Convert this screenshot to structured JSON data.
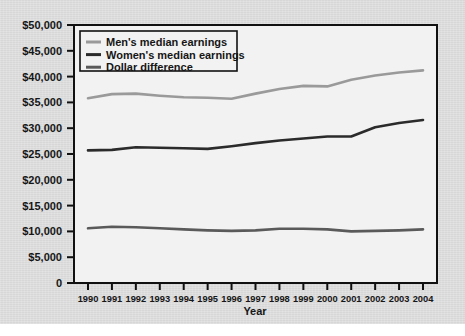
{
  "chart_data": {
    "type": "line",
    "title": "",
    "xlabel": "Year",
    "ylabel": "",
    "x": [
      1990,
      1991,
      1992,
      1993,
      1994,
      1995,
      1996,
      1997,
      1998,
      1999,
      2000,
      2001,
      2002,
      2003,
      2004
    ],
    "xtick_labels": [
      "1990",
      "1991",
      "1992",
      "1993",
      "1994",
      "1995",
      "1996",
      "1997",
      "1998",
      "1999",
      "2000",
      "2001",
      "2002",
      "2003",
      "2004"
    ],
    "ytick_labels": [
      "0",
      "$5,000",
      "$10,000",
      "$15,000",
      "$20,000",
      "$25,000",
      "$30,000",
      "$35,000",
      "$40,000",
      "$45,000",
      "$50,000"
    ],
    "ytick_values": [
      0,
      5000,
      10000,
      15000,
      20000,
      25000,
      30000,
      35000,
      40000,
      45000,
      50000
    ],
    "ylim": [
      0,
      50000
    ],
    "grid": false,
    "legend_position": "top-left",
    "series": [
      {
        "name": "Men's median earnings",
        "color": "#9a9a9a",
        "values": [
          35800,
          36600,
          36700,
          36300,
          36000,
          35900,
          35700,
          36700,
          37600,
          38200,
          38100,
          39400,
          40200,
          40800,
          41200
        ]
      },
      {
        "name": "Women's median earnings",
        "color": "#2b2b2b",
        "values": [
          25700,
          25800,
          26300,
          26200,
          26100,
          26000,
          26500,
          27100,
          27600,
          28000,
          28400,
          28400,
          30200,
          31000,
          31600
        ]
      },
      {
        "name": "Dollar difference",
        "color": "#5a5a5a",
        "values": [
          10600,
          10900,
          10800,
          10600,
          10400,
          10200,
          10100,
          10200,
          10500,
          10500,
          10400,
          10000,
          10100,
          10200,
          10400
        ]
      }
    ]
  },
  "axes": {
    "x_axis_title": "Year"
  },
  "legend": {
    "items": [
      {
        "label": "Men's median earnings"
      },
      {
        "label": "Women's median earnings"
      },
      {
        "label": "Dollar difference"
      }
    ]
  },
  "colors": {
    "figure_background": "#dedede",
    "plot_background": "#f2f2f2",
    "axis": "#111111",
    "text": "#161616",
    "men_line": "#9a9a9a",
    "women_line": "#2b2b2b",
    "difference_line": "#5a5a5a"
  }
}
